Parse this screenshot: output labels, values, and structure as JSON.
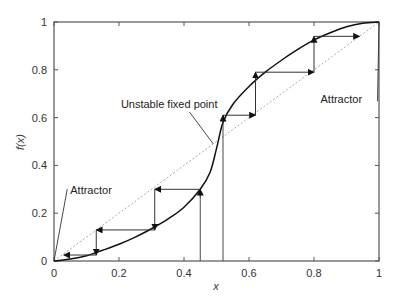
{
  "chart_data": {
    "type": "line",
    "title": "",
    "xlabel": "x",
    "ylabel": "f(x)",
    "xlim": [
      0,
      1
    ],
    "ylim": [
      0,
      1
    ],
    "grid": false,
    "legend": null,
    "x_ticks": [
      0,
      0.2,
      0.4,
      0.6,
      0.8,
      1
    ],
    "x_tick_labels": [
      "0",
      "0.2",
      "0.4",
      "0.6",
      "0.8",
      "1"
    ],
    "y_ticks": [
      0,
      0.2,
      0.4,
      0.6,
      0.8,
      1
    ],
    "y_tick_labels": [
      "0",
      "0.2",
      "0.4",
      "0.6",
      "0.8",
      "1"
    ],
    "series": [
      {
        "name": "f(x)",
        "style": "solid",
        "color": "#111111",
        "x": [
          0,
          0.05,
          0.1,
          0.15,
          0.2,
          0.25,
          0.3,
          0.35,
          0.4,
          0.45,
          0.48,
          0.5,
          0.52,
          0.55,
          0.6,
          0.65,
          0.7,
          0.75,
          0.8,
          0.85,
          0.9,
          0.95,
          1
        ],
        "y": [
          0,
          0.008,
          0.022,
          0.045,
          0.07,
          0.1,
          0.135,
          0.175,
          0.225,
          0.3,
          0.37,
          0.47,
          0.58,
          0.655,
          0.73,
          0.79,
          0.84,
          0.885,
          0.925,
          0.955,
          0.98,
          0.995,
          1
        ]
      },
      {
        "name": "y = x",
        "style": "dotted",
        "color": "#aaaaaa",
        "x": [
          0,
          1
        ],
        "y": [
          0,
          1
        ]
      }
    ],
    "cobweb_left": {
      "start_x": 0.45,
      "points": [
        [
          0.45,
          0
        ],
        [
          0.45,
          0.3
        ],
        [
          0.31,
          0.3
        ],
        [
          0.31,
          0.13
        ],
        [
          0.13,
          0.13
        ],
        [
          0.13,
          0.025
        ],
        [
          0.03,
          0.025
        ]
      ]
    },
    "cobweb_right": {
      "start_x": 0.52,
      "points": [
        [
          0.52,
          0
        ],
        [
          0.52,
          0.61
        ],
        [
          0.62,
          0.61
        ],
        [
          0.62,
          0.79
        ],
        [
          0.8,
          0.79
        ],
        [
          0.8,
          0.94
        ],
        [
          0.94,
          0.94
        ]
      ]
    },
    "annotations": [
      {
        "text": "Attractor",
        "x": 0.05,
        "y": 0.28,
        "points_to": [
          0,
          0
        ]
      },
      {
        "text": "Unstable fixed point",
        "x": 0.3,
        "y": 0.64,
        "points_to": [
          0.49,
          0.49
        ]
      },
      {
        "text": "Attractor",
        "x": 0.82,
        "y": 0.66,
        "points_to": [
          1,
          1
        ]
      }
    ]
  },
  "labels": {
    "xlabel": "x",
    "ylabel": "f(x)",
    "annot_attractor_left": "Attractor",
    "annot_unstable": "Unstable fixed point",
    "annot_attractor_right": "Attractor"
  }
}
